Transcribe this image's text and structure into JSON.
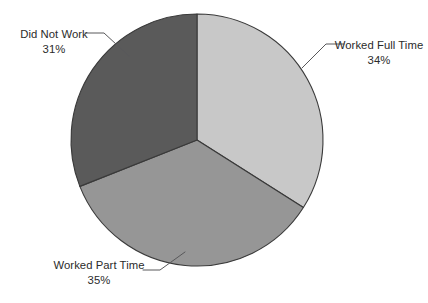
{
  "chart_data": {
    "type": "pie",
    "title": "",
    "subtitle": "",
    "xlabel": "",
    "ylabel": "",
    "grid": false,
    "legend_position": "none",
    "label_style": "external-with-leader-lines",
    "start_angle_deg": 0,
    "direction": "clockwise",
    "units": "percent",
    "total": "100%",
    "categories": [
      "Worked Full Time",
      "Worked Part Time",
      "Did Not Work"
    ],
    "values": [
      34,
      35,
      31
    ],
    "slices": [
      {
        "label": "Worked Full Time",
        "value": 34,
        "value_text": "34%",
        "color": "#c8c8c8",
        "start_angle_deg": 0,
        "end_angle_deg": 122.4
      },
      {
        "label": "Worked Part Time",
        "value": 35,
        "value_text": "35%",
        "color": "#969696",
        "start_angle_deg": 122.4,
        "end_angle_deg": 248.4
      },
      {
        "label": "Did Not Work",
        "value": 31,
        "value_text": "31%",
        "color": "#5a5a5a",
        "start_angle_deg": 248.4,
        "end_angle_deg": 360
      }
    ]
  },
  "labels": {
    "worked_full_time": {
      "name": "Worked Full Time",
      "percent": "34%"
    },
    "worked_part_time": {
      "name": "Worked Part Time",
      "percent": "35%"
    },
    "did_not_work": {
      "name": "Did Not Work",
      "percent": "31%"
    }
  },
  "colors": {
    "background": "#ffffff",
    "slice_worked_full_time": "#c8c8c8",
    "slice_worked_part_time": "#969696",
    "slice_did_not_work": "#5a5a5a",
    "slice_outline": "#3a3a3a",
    "leader_line": "#58585a",
    "text": "#2b2b2b"
  }
}
